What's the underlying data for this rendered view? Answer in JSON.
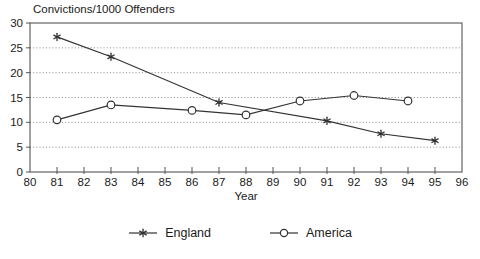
{
  "chart_data": {
    "type": "line",
    "title": "Convictions/1000 Offenders",
    "xlabel": "Year",
    "ylabel": "",
    "xlim": [
      80,
      96
    ],
    "ylim": [
      0,
      30
    ],
    "x_ticks": [
      80,
      81,
      82,
      83,
      84,
      85,
      86,
      87,
      88,
      89,
      90,
      91,
      92,
      93,
      94,
      95,
      96
    ],
    "y_ticks": [
      0,
      5,
      10,
      15,
      20,
      25,
      30
    ],
    "grid": "horizontal-dotted",
    "legend_position": "bottom-center",
    "series": [
      {
        "name": "England",
        "marker": "star",
        "x": [
          81,
          83,
          87,
          91,
          93,
          95
        ],
        "y": [
          27.2,
          23.2,
          14.0,
          10.3,
          7.7,
          6.3
        ]
      },
      {
        "name": "America",
        "marker": "circle",
        "x": [
          81,
          83,
          86,
          88,
          90,
          92,
          94
        ],
        "y": [
          10.5,
          13.5,
          12.4,
          11.5,
          14.3,
          15.4,
          14.3
        ]
      }
    ],
    "colors": {
      "line": "#333333",
      "grid": "#8a8a8a",
      "frame": "#555555",
      "text": "#1a1a1a",
      "background": "#ffffff"
    }
  }
}
